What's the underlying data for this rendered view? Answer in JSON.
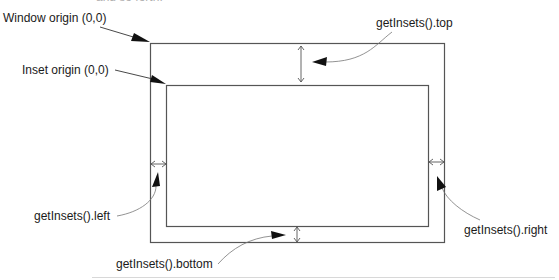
{
  "top_fragment": "and so forth.",
  "labels": {
    "window_origin": "Window origin (0,0)",
    "inset_origin": "Inset origin (0,0)",
    "insets_top": "getInsets().top",
    "insets_left": "getInsets().left",
    "insets_right": "getInsets().right",
    "insets_bottom": "getInsets().bottom"
  },
  "geometry": {
    "outer_rect": {
      "x": 150,
      "y": 43,
      "w": 294,
      "h": 199
    },
    "inner_rect": {
      "x": 166,
      "y": 85,
      "w": 262,
      "h": 141
    }
  },
  "colors": {
    "line": "#555555",
    "arrow": "#111111",
    "text": "#1a1a1a"
  }
}
